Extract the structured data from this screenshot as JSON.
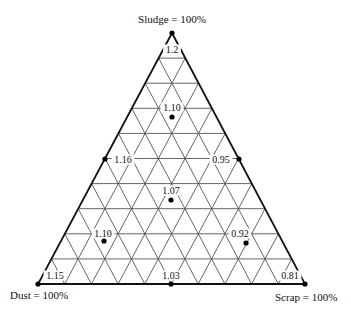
{
  "diagram": {
    "type": "ternary",
    "grid_divisions": 10,
    "vertices": {
      "top": {
        "label": "Sludge = 100%",
        "x": 172,
        "y": 33
      },
      "left": {
        "label": "Dust = 100%",
        "x": 38,
        "y": 284
      },
      "right": {
        "label": "Scrap = 100%",
        "x": 305,
        "y": 284
      }
    },
    "colors": {
      "outline": "#111111",
      "grid": "#555555",
      "point": "#000000"
    },
    "points": [
      {
        "id": "sludge-100",
        "value": "1.2",
        "x": 172,
        "y": 33,
        "label_x": 172,
        "label_y": 53,
        "anchor": "middle"
      },
      {
        "id": "sludge-70",
        "value": "1.10",
        "x": 172,
        "y": 117,
        "label_x": 172,
        "label_y": 111,
        "anchor": "middle"
      },
      {
        "id": "dust-sludge-50",
        "value": "1.16",
        "x": 105,
        "y": 159,
        "label_x": 123,
        "label_y": 163,
        "anchor": "middle"
      },
      {
        "id": "scrap-sludge-50",
        "value": "0.95",
        "x": 239,
        "y": 159,
        "label_x": 221,
        "label_y": 163,
        "anchor": "middle"
      },
      {
        "id": "center",
        "value": "1.07",
        "x": 171,
        "y": 200,
        "label_x": 171,
        "label_y": 194,
        "anchor": "middle"
      },
      {
        "id": "dust-rich",
        "value": "1.10",
        "x": 104,
        "y": 241,
        "label_x": 103,
        "label_y": 237,
        "anchor": "middle"
      },
      {
        "id": "scrap-rich",
        "value": "0.92",
        "x": 246,
        "y": 243,
        "label_x": 240,
        "label_y": 237,
        "anchor": "middle"
      },
      {
        "id": "dust-100",
        "value": "1.15",
        "x": 38,
        "y": 284,
        "label_x": 55,
        "label_y": 279,
        "anchor": "middle"
      },
      {
        "id": "dust-scrap-50",
        "value": "1.03",
        "x": 171,
        "y": 284,
        "label_x": 171,
        "label_y": 279,
        "anchor": "middle"
      },
      {
        "id": "scrap-100",
        "value": "0.81",
        "x": 305,
        "y": 284,
        "label_x": 290,
        "label_y": 279,
        "anchor": "middle"
      }
    ]
  }
}
